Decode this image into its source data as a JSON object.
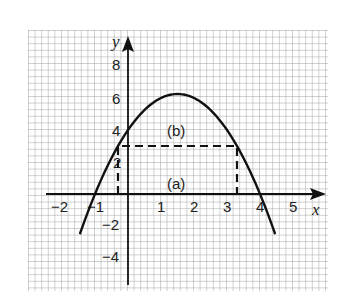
{
  "chart_data": {
    "type": "line",
    "title": "",
    "xlabel": "x",
    "ylabel": "y",
    "xlim": [
      -2.5,
      5.9
    ],
    "ylim": [
      -5.9,
      10.1
    ],
    "grid": true,
    "x_ticks": [
      {
        "value": -2,
        "label": "−2"
      },
      {
        "value": -1,
        "label": "−1"
      },
      {
        "value": 1,
        "label": "1"
      },
      {
        "value": 2,
        "label": "2"
      },
      {
        "value": 3,
        "label": "3"
      },
      {
        "value": 4,
        "label": "4"
      },
      {
        "value": 5,
        "label": "5"
      }
    ],
    "y_ticks": [
      {
        "value": 8,
        "label": "8"
      },
      {
        "value": 6,
        "label": "6"
      },
      {
        "value": 4,
        "label": "4"
      },
      {
        "value": 2,
        "label": "2"
      },
      {
        "value": -2,
        "label": "−2"
      },
      {
        "value": -4,
        "label": "−4"
      }
    ],
    "series": [
      {
        "name": "parabola",
        "equation": "y = -x^2 + 3x + 4",
        "style": "solid",
        "x_range": [
          -1.45,
          4.45
        ],
        "key_points": {
          "roots": [
            -1,
            4
          ],
          "y_intercept": 4,
          "vertex": [
            1.5,
            6.25
          ]
        }
      },
      {
        "name": "rectangle",
        "style": "dashed",
        "corners": [
          [
            -0.3,
            0
          ],
          [
            -0.3,
            3
          ],
          [
            3.3,
            3
          ],
          [
            3.3,
            0
          ]
        ]
      }
    ],
    "annotations": [
      {
        "text": "(a)",
        "x": 1.55,
        "y": 0.6
      },
      {
        "text": "(b)",
        "x": 1.55,
        "y": 3.9
      }
    ]
  },
  "labels": {
    "x_axis": "x",
    "y_axis": "y",
    "region_a": "(a)",
    "region_b": "(b)",
    "x_neg2": "−2",
    "x_neg1": "−1",
    "x_1": "1",
    "x_2": "2",
    "x_3": "3",
    "x_4": "4",
    "x_5": "5",
    "y_8": "8",
    "y_6": "6",
    "y_4": "4",
    "y_2": "2",
    "y_neg2": "−2",
    "y_neg4": "−4"
  }
}
